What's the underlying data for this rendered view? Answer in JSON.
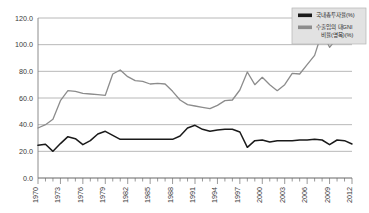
{
  "chart_data": {
    "type": "line",
    "title": "",
    "subtitle": "",
    "xlabel": "",
    "ylabel": "",
    "xlim": [
      1970,
      2012
    ],
    "ylim": [
      0.0,
      120.0
    ],
    "grid": true,
    "legend_position": "top-right",
    "y_ticks": [
      "0.0",
      "20.0",
      "40.0",
      "60.0",
      "80.0",
      "100.0",
      "120.0"
    ],
    "y_tick_values": [
      0,
      20,
      40,
      60,
      80,
      100,
      120
    ],
    "x_tick_labels": [
      "1970",
      "1973",
      "1976",
      "1979",
      "1982",
      "1985",
      "1988",
      "1991",
      "1994",
      "1997",
      "2000",
      "2003",
      "2006",
      "2009",
      "2012"
    ],
    "x_tick_values": [
      1970,
      1973,
      1976,
      1979,
      1982,
      1985,
      1988,
      1991,
      1994,
      1997,
      2000,
      2003,
      2006,
      2009,
      2012
    ],
    "x": [
      1970,
      1971,
      1972,
      1973,
      1974,
      1975,
      1976,
      1977,
      1978,
      1979,
      1980,
      1981,
      1982,
      1983,
      1984,
      1985,
      1986,
      1987,
      1988,
      1989,
      1990,
      1991,
      1992,
      1993,
      1994,
      1995,
      1996,
      1997,
      1998,
      1999,
      2000,
      2001,
      2002,
      2003,
      2004,
      2005,
      2006,
      2007,
      2008,
      2009,
      2010,
      2011,
      2012
    ],
    "series": [
      {
        "name": "국내총투자율(%)",
        "color": "#1a1a1a",
        "width": 1.5,
        "values": [
          24.5,
          25.3,
          20.0,
          25.8,
          31.0,
          29.5,
          25.0,
          28.0,
          33.0,
          35.0,
          32.0,
          29.0,
          29.0,
          29.0,
          29.0,
          29.0,
          29.0,
          29.0,
          29.0,
          31.5,
          37.5,
          39.5,
          36.5,
          35.0,
          36.0,
          36.5,
          36.5,
          34.5,
          23.0,
          28.0,
          28.5,
          27.0,
          28.0,
          28.0,
          28.0,
          28.5,
          28.5,
          29.0,
          28.5,
          25.0,
          28.5,
          28.0,
          25.5
        ]
      },
      {
        "name": "수출입의 대GNI 비율(명목)(%)",
        "color": "#8c8c8c",
        "width": 1.3,
        "values": [
          37.5,
          40.0,
          44.0,
          58.0,
          65.5,
          65.0,
          63.5,
          63.0,
          62.5,
          62.0,
          78.0,
          81.0,
          76.0,
          73.0,
          72.5,
          70.5,
          71.0,
          70.5,
          65.0,
          58.5,
          55.0,
          54.0,
          53.0,
          52.0,
          54.5,
          58.0,
          58.5,
          66.0,
          79.5,
          70.0,
          75.5,
          70.0,
          65.5,
          70.0,
          78.5,
          78.0,
          85.0,
          92.0,
          109.5,
          98.0,
          105.0,
          111.0,
          112.0
        ]
      }
    ]
  },
  "legend": {
    "entries": [
      {
        "label": "국내총투자율(%)",
        "color": "#1a1a1a"
      },
      {
        "label": "수출입의 대GNI",
        "label2": "비율(명목)(%)",
        "color": "#8c8c8c"
      }
    ]
  }
}
